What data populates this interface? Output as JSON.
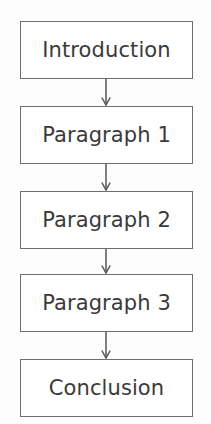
{
  "diagram": {
    "type": "flowchart",
    "orientation": "vertical-top-to-bottom",
    "canvas": {
      "width": 211,
      "height": 424,
      "background": "#fdfdfd"
    },
    "style": {
      "node_fill": "#ffffff",
      "node_border_color": "#6e6e6e",
      "node_border_width": 1.4,
      "text_color": "#3a3a3a",
      "font_size": 21,
      "connector_color": "#555555",
      "arrowhead_style": "open-chevron"
    },
    "nodes": [
      {
        "id": "node-introduction",
        "label": "Introduction",
        "x": 20,
        "y": 21,
        "width": 173,
        "height": 58
      },
      {
        "id": "node-paragraph-1",
        "label": "Paragraph 1",
        "x": 20,
        "y": 106,
        "width": 173,
        "height": 58
      },
      {
        "id": "node-paragraph-2",
        "label": "Paragraph 2",
        "x": 20,
        "y": 191,
        "width": 173,
        "height": 58
      },
      {
        "id": "node-paragraph-3",
        "label": "Paragraph 3",
        "x": 20,
        "y": 274,
        "width": 173,
        "height": 58
      },
      {
        "id": "node-conclusion",
        "label": "Conclusion",
        "x": 20,
        "y": 359,
        "width": 173,
        "height": 58
      }
    ],
    "connectors": [
      {
        "id": "arrow-intro-to-p1",
        "from": "node-introduction",
        "to": "node-paragraph-1",
        "x": 106,
        "y_start": 79,
        "y_end": 106
      },
      {
        "id": "arrow-p1-to-p2",
        "from": "node-paragraph-1",
        "to": "node-paragraph-2",
        "x": 106,
        "y_start": 164,
        "y_end": 191
      },
      {
        "id": "arrow-p2-to-p3",
        "from": "node-paragraph-2",
        "to": "node-paragraph-3",
        "x": 106,
        "y_start": 249,
        "y_end": 274
      },
      {
        "id": "arrow-p3-to-conclusion",
        "from": "node-paragraph-3",
        "to": "node-conclusion",
        "x": 106,
        "y_start": 332,
        "y_end": 359
      }
    ]
  }
}
